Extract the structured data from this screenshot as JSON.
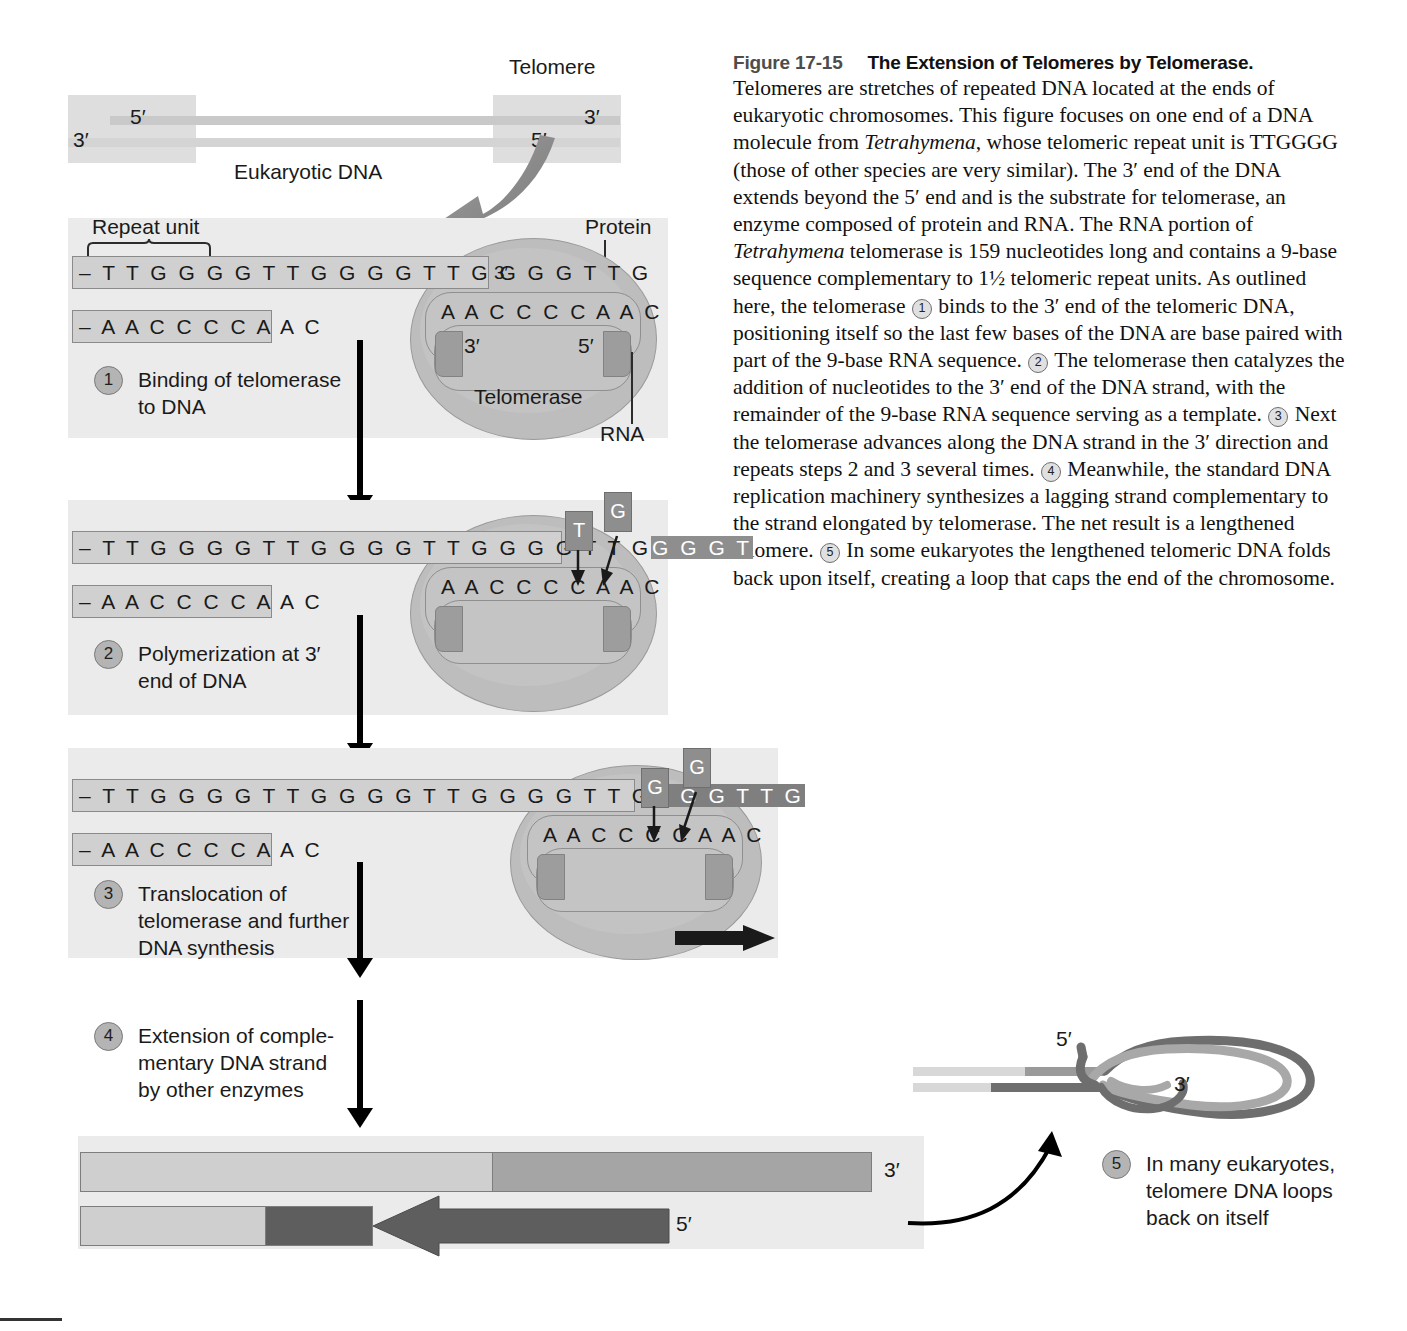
{
  "figure": {
    "number": "Figure 17-15",
    "title": "The Extension of Telomeres by Telomerase.",
    "caption_p1": "Telomeres are stretches of repeated DNA located at the ends of eukaryotic chromosomes. This figure focuses on one end of a DNA molecule from ",
    "species": "Tetrahymena",
    "caption_p2": ", whose telomeric repeat unit is TTGGGG (those of other species are very similar). The 3′ end of the DNA extends beyond the 5′ end and is the substrate for telomerase, an enzyme composed of protein and RNA. The RNA portion of ",
    "species2": "Tetrahymena",
    "caption_p3": " telomerase is 159 nucleotides long and contains a 9-base sequence complementary to 1½ telomeric repeat units. As outlined here, the telomerase ",
    "caption_p4": " binds to the 3′ end of the telomeric DNA, positioning itself so the last few bases of the DNA are base paired with part of the 9-base RNA sequence. ",
    "caption_p5": " The telomerase then catalyzes the addition of nucleotides to the 3′ end of the DNA strand, with the remainder of the 9-base RNA sequence serving as a template. ",
    "caption_p6": " Next the telomerase advances along the DNA strand in the 3′ direction and repeats steps 2 and 3 several times. ",
    "caption_p7": " Meanwhile, the standard DNA replication machinery synthesizes a lagging strand complementary to the strand elongated by telomerase. The net result is a lengthened telomere. ",
    "caption_p8": " In some eukaryotes the lengthened telomeric DNA folds back upon itself, creating a loop that caps the end of the chromosome.",
    "inline_markers": [
      "1",
      "2",
      "3",
      "4",
      "5"
    ]
  },
  "overview": {
    "telomere_label": "Telomere",
    "dna_label": "Eukaryotic DNA",
    "left_five_prime": "5′",
    "left_three_prime": "3′",
    "right_three_prime": "3′",
    "right_five_prime": "5′"
  },
  "step1": {
    "number": "1",
    "text_line1": "Binding of telomerase",
    "text_line2": "to DNA",
    "repeat_unit_label": "Repeat unit",
    "protein_label": "Protein",
    "rna_label": "RNA",
    "telomerase_label": "Telomerase",
    "top_strand": "– T T G G G G T T G G G G T T G G G G T T G",
    "top_strand_end": "3′",
    "bottom_strand": "– A A C C C C A A C",
    "rna_template": "A A C C C C A A C",
    "rna_three_prime": "3′",
    "rna_five_prime": "5′"
  },
  "step2": {
    "number": "2",
    "text_line1": "Polymerization at 3′",
    "text_line2": "end of DNA",
    "top_strand_existing": "– T T G G G G T T G G G G T T G G G G T T G",
    "top_strand_new": "G G G T",
    "bottom_strand": "– A A C C C C A A C",
    "rna_template": "A A C C C C A A C",
    "incoming_nt_1": "T",
    "incoming_nt_2": "G"
  },
  "step3": {
    "number": "3",
    "text_line1": "Translocation of",
    "text_line2": "telomerase and further",
    "text_line3": "DNA synthesis",
    "top_strand_existing": "– T T G G G G T T G G G G T T G G G G T T G",
    "top_strand_new": "G G G T T G",
    "bottom_strand": "– A A C C C C A A C",
    "rna_template": "A A C C C C A A C",
    "incoming_nt_1": "G",
    "incoming_nt_2": "G"
  },
  "step4": {
    "number": "4",
    "text_line1": "Extension of comple-",
    "text_line2": "mentary DNA strand",
    "text_line3": "by other enzymes",
    "top_three_prime": "3′",
    "bottom_five_prime": "5′"
  },
  "step5": {
    "number": "5",
    "text_line1": "In many eukaryotes,",
    "text_line2": "telomere DNA loops",
    "text_line3": "back on itself",
    "loop_five_prime": "5′",
    "loop_three_prime": "3′"
  },
  "colors": {
    "panel_background": "#ebebeb",
    "strand_light": "#d0d0d0",
    "strand_new": "#8e8e8e",
    "strand_dark": "#7a7a7a",
    "telomerase_protein": "#bdbdbd",
    "step_circle": "#b4b4b4",
    "arrow": "#000000",
    "loop_dark": "#6e6e6e",
    "loop_light": "#b0b0b0"
  }
}
